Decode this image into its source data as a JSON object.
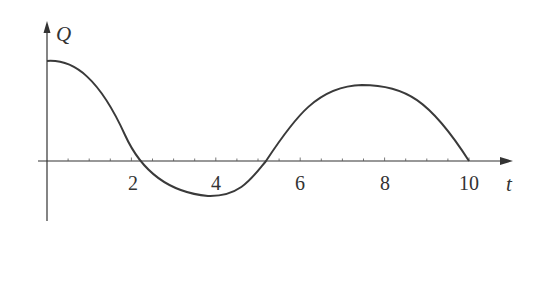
{
  "chart_data": {
    "type": "line",
    "title": "",
    "xlabel": "t",
    "ylabel": "Q",
    "xlim": [
      0,
      10.5
    ],
    "ylim": [
      -6,
      13
    ],
    "grid": false,
    "legend": null,
    "x_ticks_labeled": [
      2,
      4,
      6,
      8,
      10
    ],
    "x_ticks_minor_step": 0.5,
    "y_ticks": [],
    "series": [
      {
        "name": "Q(t)",
        "color": "#3a3a3a",
        "x": [
          0,
          0.5,
          1.0,
          1.5,
          2.0,
          2.5,
          3.0,
          3.5,
          3.8,
          4.0,
          4.5,
          5.0,
          5.5,
          6.0,
          6.5,
          7.0,
          7.45,
          8.0,
          8.5,
          9.0,
          9.5,
          10.0
        ],
        "values": [
          10.0,
          9.5,
          7.5,
          4.5,
          1.0,
          -1.6,
          -3.0,
          -3.5,
          -3.6,
          -3.5,
          -2.6,
          -0.8,
          1.5,
          4.0,
          6.0,
          7.3,
          7.6,
          7.4,
          6.5,
          4.8,
          2.6,
          0.0
        ]
      }
    ],
    "annotations": [
      "Q",
      "t"
    ]
  },
  "axes": {
    "x_label": "t",
    "y_label": "Q",
    "tick_labels": [
      "2",
      "4",
      "6",
      "8",
      "10"
    ]
  }
}
